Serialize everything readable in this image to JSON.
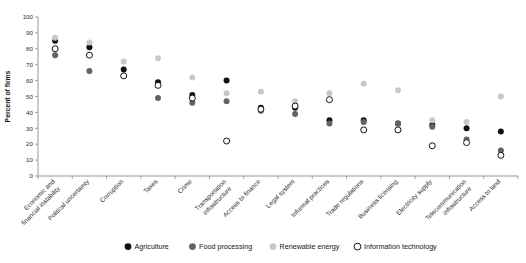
{
  "chart_data": {
    "type": "scatter",
    "title": "",
    "xlabel": "",
    "ylabel": "Percent of firms",
    "ylim": [
      0,
      100
    ],
    "yticks": [
      0,
      10,
      20,
      30,
      40,
      50,
      60,
      70,
      80,
      90,
      100
    ],
    "grid": false,
    "legend_position": "bottom",
    "categories": [
      "Economic and financial instability",
      "Political uncertainty",
      "Corruption",
      "Taxes",
      "Crime",
      "Transportation infrastructure",
      "Access to finance",
      "Legal system",
      "Informal practices",
      "Trade regulations",
      "Business licensing",
      "Electricity supply",
      "Telecommunication infrastructure",
      "Access to land"
    ],
    "series": [
      {
        "name": "Agriculture",
        "color": "#111111",
        "marker": "filled-circle",
        "values": [
          85,
          81,
          67,
          59,
          51,
          60,
          43,
          43,
          35,
          35,
          33,
          32,
          30,
          28
        ]
      },
      {
        "name": "Food processing",
        "color": "#636363",
        "marker": "filled-circle",
        "values": [
          76,
          66,
          63,
          49,
          46,
          47,
          41,
          39,
          33,
          34,
          33,
          31,
          23,
          16
        ]
      },
      {
        "name": "Renewable energy",
        "color": "#c8c8c8",
        "marker": "filled-circle",
        "values": [
          87,
          84,
          72,
          74,
          62,
          52,
          53,
          47,
          52,
          58,
          54,
          35,
          34,
          50
        ]
      },
      {
        "name": "Information technology",
        "color": "#111111",
        "marker": "open-circle",
        "values": [
          80,
          76,
          63,
          57,
          49,
          22,
          42,
          44,
          48,
          29,
          29,
          19,
          21,
          13
        ]
      }
    ]
  },
  "legend": {
    "items": [
      {
        "label": "Agriculture",
        "marker": "filled-circle",
        "color": "#111111"
      },
      {
        "label": "Food processing",
        "marker": "filled-circle",
        "color": "#636363"
      },
      {
        "label": "Renewable energy",
        "marker": "filled-circle",
        "color": "#c8c8c8"
      },
      {
        "label": "Information technology",
        "marker": "open-circle",
        "color": "#111111"
      }
    ]
  }
}
